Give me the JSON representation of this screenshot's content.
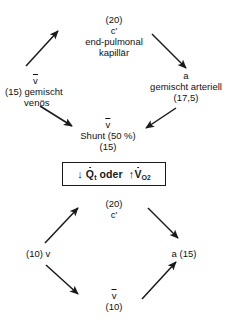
{
  "figure": {
    "title_present": false,
    "background_color": "#ffffff",
    "ink_color": "#1a1a1a"
  },
  "top_diagram": {
    "name": "oxygen-content-cycle-normal",
    "top_node": {
      "value": "(20)",
      "symbol": "c'",
      "line1": "end-pulmonal",
      "line2": "kapillär"
    },
    "right_node": {
      "symbol": "a",
      "line1": "gemischt arteriell",
      "value": "(17,5)"
    },
    "bottom_node": {
      "symbol": "v",
      "label": "Shunt (50 %)",
      "value": "(15)"
    },
    "left_node": {
      "value": "(15)",
      "symbol": "v",
      "line1": "gemischt",
      "line2": "venös"
    }
  },
  "middle_box": {
    "name": "condition-box",
    "down_arrow": "↓",
    "q_symbol": "Q",
    "q_subscript": "t",
    "conjunction": "oder",
    "up_arrow": "↑",
    "v_symbol": "V",
    "v_subscript": "O",
    "v_subscript2": "2",
    "full_text": "↓ Q̇t oder ↑V̇O2"
  },
  "bottom_diagram": {
    "name": "oxygen-content-cycle-altered",
    "top_node": {
      "value": "(20)",
      "symbol": "c'"
    },
    "right_node": {
      "label": "a (15)"
    },
    "bottom_node": {
      "symbol": "v",
      "value": "(10)"
    },
    "left_node": {
      "value": "(10)",
      "symbol": "v"
    }
  }
}
